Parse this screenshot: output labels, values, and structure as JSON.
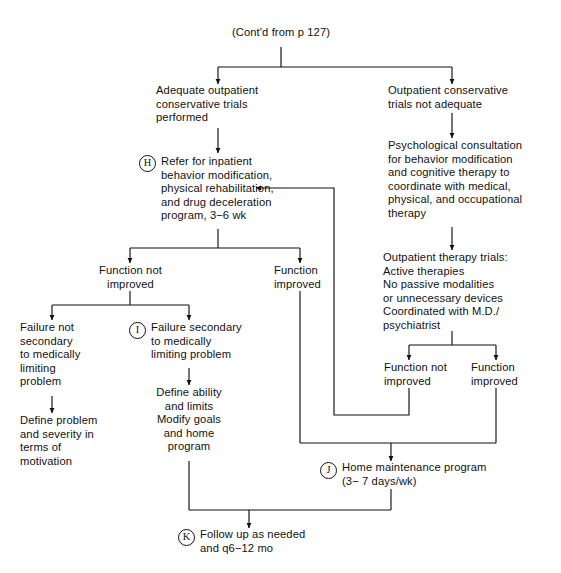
{
  "figure": {
    "type": "clinical-algorithm-flowchart",
    "ink_color": "#111111",
    "background": "#ffffff"
  },
  "nodes": {
    "cont_from": {
      "text": "(Cont'd from p 127)"
    },
    "adequate_trials": {
      "text": "Adequate outpatient\nconservative trials\nperformed"
    },
    "not_adequate": {
      "text": "Outpatient conservative\ntrials not adequate"
    },
    "refer_inpatient": {
      "tag": "H",
      "text": "Refer for inpatient\nbehavior modification,\nphysical rehabilitation,\nand drug deceleration\nprogram, 3−6 wk"
    },
    "psych_consult": {
      "text": "Psychological consultation\nfor behavior modification\nand cognitive therapy to\ncoordinate with medical,\nphysical, and occupational\ntherapy"
    },
    "outpatient_trials": {
      "text": "Outpatient therapy trials:\n  Active therapies\n  No passive modalities\n    or unnecessary devices\n  Coordinated with M.D./\n    psychiatrist"
    },
    "left_function_not_improved": {
      "text": "Function not\nimproved"
    },
    "left_function_improved": {
      "text": "Function\nimproved"
    },
    "right_function_not_improved": {
      "text": "Function not\nimproved"
    },
    "right_function_improved": {
      "text": "Function\nimproved"
    },
    "failure_not_secondary": {
      "text": "Failure not\nsecondary\nto medically\nlimiting\nproblem"
    },
    "failure_secondary": {
      "tag": "I",
      "text": "Failure secondary\nto medically\nlimiting problem"
    },
    "define_problem": {
      "text": "Define problem\nand severity in\nterms of\nmotivation"
    },
    "define_ability": {
      "text": "Define ability\nand limits\nModify goals\nand home\nprogram"
    },
    "home_maintenance": {
      "tag": "J",
      "text": "Home maintenance program\n(3− 7 days/wk)"
    },
    "follow_up": {
      "tag": "K",
      "text": "Follow up as needed\nand q6−12 mo"
    }
  },
  "edges": [
    {
      "from": "cont_from",
      "to": "adequate_trials",
      "label": ""
    },
    {
      "from": "cont_from",
      "to": "not_adequate",
      "label": ""
    },
    {
      "from": "adequate_trials",
      "to": "refer_inpatient",
      "label": ""
    },
    {
      "from": "not_adequate",
      "to": "psych_consult",
      "label": ""
    },
    {
      "from": "psych_consult",
      "to": "outpatient_trials",
      "label": ""
    },
    {
      "from": "refer_inpatient",
      "to": "left_function_not_improved",
      "label": ""
    },
    {
      "from": "refer_inpatient",
      "to": "left_function_improved",
      "label": ""
    },
    {
      "from": "outpatient_trials",
      "to": "right_function_not_improved",
      "label": ""
    },
    {
      "from": "outpatient_trials",
      "to": "right_function_improved",
      "label": ""
    },
    {
      "from": "left_function_not_improved",
      "to": "failure_not_secondary",
      "label": ""
    },
    {
      "from": "left_function_not_improved",
      "to": "failure_secondary",
      "label": ""
    },
    {
      "from": "failure_not_secondary",
      "to": "define_problem",
      "label": ""
    },
    {
      "from": "failure_secondary",
      "to": "define_ability",
      "label": ""
    },
    {
      "from": "right_function_not_improved",
      "to": "refer_inpatient",
      "label": "feedback loop"
    },
    {
      "from": "right_function_improved",
      "to": "home_maintenance",
      "label": ""
    },
    {
      "from": "left_function_improved",
      "to": "home_maintenance",
      "label": ""
    },
    {
      "from": "home_maintenance",
      "to": "follow_up",
      "label": ""
    },
    {
      "from": "define_ability",
      "to": "follow_up",
      "label": ""
    }
  ]
}
